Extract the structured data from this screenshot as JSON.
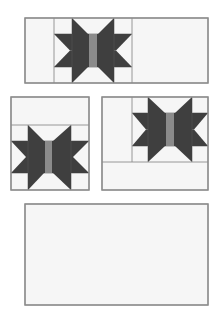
{
  "colors": {
    "background": "#ffffff",
    "panel_fill": "#f6f6f6",
    "outline": "#8c8c8c",
    "star_dark": "#3f3f3f",
    "center_strip": "#8b8b8b"
  },
  "layout_panels": [
    {
      "id": "top-panel",
      "rect": [
        25,
        18,
        183,
        65
      ],
      "divider_lines": [
        [
          54,
          18,
          54,
          83
        ],
        [
          132,
          18,
          132,
          83
        ]
      ],
      "star": {
        "cols": [
          54,
          72,
          114,
          132
        ],
        "rows": [
          18,
          34,
          67,
          83
        ],
        "strip": [
          89,
          97
        ]
      }
    },
    {
      "id": "middle-left-panel",
      "rect": [
        11,
        97,
        78,
        93
      ],
      "divider_lines": [
        [
          11,
          125,
          89,
          125
        ]
      ],
      "star": {
        "cols": [
          11,
          28,
          71,
          89
        ],
        "rows": [
          125,
          141,
          173,
          190
        ],
        "strip": [
          45,
          52
        ]
      }
    },
    {
      "id": "middle-right-panel",
      "rect": [
        102,
        97,
        106,
        93
      ],
      "divider_lines": [
        [
          132,
          97,
          132,
          162
        ],
        [
          102,
          162,
          208,
          162
        ]
      ],
      "star": {
        "cols": [
          132,
          148,
          192,
          208
        ],
        "rows": [
          97,
          113,
          146,
          162
        ],
        "strip": [
          166,
          174
        ]
      }
    },
    {
      "id": "bottom-panel",
      "rect": [
        25,
        204,
        183,
        101
      ],
      "divider_lines": [],
      "star": null
    }
  ]
}
